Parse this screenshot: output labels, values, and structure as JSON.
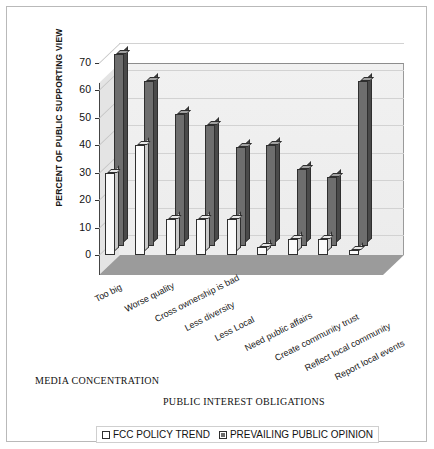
{
  "chart_data": {
    "type": "bar",
    "title": "",
    "xlabel": "",
    "ylabel": "PERCENT OF PUBLIC SUPPORTING VIEW",
    "ylim": [
      0,
      70
    ],
    "yticks": [
      0,
      10,
      20,
      30,
      40,
      50,
      60,
      70
    ],
    "grid": true,
    "legend_position": "bottom",
    "categories": [
      "Too big",
      "Worse quality",
      "Cross ownership is bad",
      "Less diversity",
      "Less Local",
      "Need public affairs",
      "Create community trust",
      "Reflect local community",
      "Report local events"
    ],
    "series": [
      {
        "name": "FCC POLICY TREND",
        "color": "#fbfbfb",
        "values": [
          30,
          40,
          13,
          13,
          13,
          3,
          6,
          6,
          2
        ]
      },
      {
        "name": "PREVAILING PUBLIC OPINION",
        "color": "#6e6e6e",
        "values": [
          70,
          60,
          48,
          44,
          36,
          37,
          28,
          25,
          60
        ]
      }
    ],
    "group_labels": [
      "MEDIA CONCENTRATION",
      "PUBLIC INTEREST OBLIGATIONS"
    ]
  },
  "legend": {
    "items": [
      {
        "label": "FCC POLICY TREND",
        "swatch": "light"
      },
      {
        "label": "PREVAILING PUBLIC OPINION",
        "swatch": "dark"
      }
    ]
  }
}
